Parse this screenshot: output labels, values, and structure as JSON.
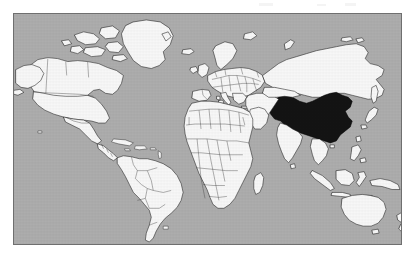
{
  "page": {
    "background_color": "#ffffff",
    "width": 417,
    "height": 261
  },
  "map": {
    "name": "world-map",
    "projection": "mercator",
    "frame": {
      "border_color": "#6f6f6f",
      "x": 13,
      "y": 13,
      "width": 389,
      "height": 232
    },
    "ocean_color": "#adadad",
    "land_color": "#f7f7f7",
    "border_color": "#1c1c1c",
    "highlight_color": "#141414",
    "title": "",
    "caption": "",
    "legend": [],
    "highlighted_countries": [
      "China"
    ],
    "visible_continents": [
      "North America",
      "South America",
      "Europe",
      "Africa",
      "Asia",
      "Australia"
    ],
    "labels": []
  },
  "chart_data": {
    "type": "map",
    "projection": "mercator",
    "categories": [
      "China",
      "Rest of world"
    ],
    "values": [
      1,
      0
    ],
    "series": [
      {
        "name": "highlighted",
        "values": [
          1,
          0
        ]
      }
    ],
    "legend_position": "none",
    "grid": false
  }
}
